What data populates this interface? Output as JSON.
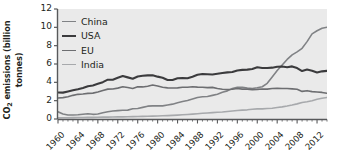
{
  "chart_data": {
    "type": "line",
    "title": "",
    "xlabel": "",
    "ylabel": "CO2 emissions (billion tonnes)",
    "ylabel_line1": "CO",
    "ylabel_sub": "2",
    "ylabel_line1_rest": " emissions (billion",
    "ylabel_line2": "tonnes)",
    "xlim": [
      1960,
      2014
    ],
    "ylim": [
      0,
      12
    ],
    "grid": false,
    "legend_position": "top-left",
    "y_ticks": [
      12,
      10,
      8,
      6,
      4,
      2,
      0
    ],
    "x_ticks": [
      1960,
      1964,
      1968,
      1972,
      1976,
      1980,
      1984,
      1988,
      1992,
      1996,
      2000,
      2004,
      2008,
      2012
    ],
    "x_tick_labels": [
      "1960",
      "1964",
      "1968",
      "1972",
      "1976",
      "1980",
      "1984",
      "1988",
      "1992",
      "1996",
      "2000",
      "2004",
      "2008",
      "2012"
    ],
    "x_minor_tick_interval": 1,
    "plot_background": "#eaeaea",
    "axis_color": "#58595b",
    "text_color": "#231f20",
    "x": [
      1960,
      1961,
      1962,
      1963,
      1964,
      1965,
      1966,
      1967,
      1968,
      1969,
      1970,
      1971,
      1972,
      1973,
      1974,
      1975,
      1976,
      1977,
      1978,
      1979,
      1980,
      1981,
      1982,
      1983,
      1984,
      1985,
      1986,
      1987,
      1988,
      1989,
      1990,
      1991,
      1992,
      1993,
      1994,
      1995,
      1996,
      1997,
      1998,
      1999,
      2000,
      2001,
      2002,
      2003,
      2004,
      2005,
      2006,
      2007,
      2008,
      2009,
      2010,
      2011,
      2012,
      2013,
      2014
    ],
    "series": [
      {
        "name": "China",
        "color": "#808285",
        "width": 1.6,
        "values": [
          0.78,
          0.55,
          0.44,
          0.44,
          0.47,
          0.52,
          0.58,
          0.51,
          0.54,
          0.68,
          0.79,
          0.87,
          0.91,
          0.96,
          0.97,
          1.12,
          1.15,
          1.27,
          1.4,
          1.43,
          1.45,
          1.43,
          1.52,
          1.62,
          1.77,
          1.9,
          2.02,
          2.18,
          2.35,
          2.42,
          2.46,
          2.58,
          2.7,
          2.92,
          3.07,
          3.33,
          3.46,
          3.47,
          3.38,
          3.32,
          3.4,
          3.52,
          3.89,
          4.59,
          5.29,
          5.9,
          6.5,
          6.99,
          7.32,
          7.71,
          8.44,
          9.29,
          9.63,
          9.9,
          10.01
        ]
      },
      {
        "name": "USA",
        "color": "#3b3b3d",
        "width": 2.1,
        "values": [
          2.89,
          2.88,
          3.0,
          3.13,
          3.25,
          3.39,
          3.57,
          3.66,
          3.84,
          4.02,
          4.29,
          4.29,
          4.5,
          4.69,
          4.54,
          4.39,
          4.63,
          4.71,
          4.76,
          4.77,
          4.62,
          4.5,
          4.26,
          4.26,
          4.45,
          4.46,
          4.45,
          4.62,
          4.83,
          4.91,
          4.89,
          4.85,
          4.93,
          5.02,
          5.09,
          5.12,
          5.3,
          5.36,
          5.39,
          5.46,
          5.64,
          5.56,
          5.57,
          5.6,
          5.7,
          5.72,
          5.65,
          5.74,
          5.56,
          5.23,
          5.39,
          5.27,
          5.08,
          5.2,
          5.25
        ]
      },
      {
        "name": "EU",
        "color": "#6d6e71",
        "width": 1.6,
        "values": [
          2.29,
          2.33,
          2.42,
          2.58,
          2.69,
          2.73,
          2.79,
          2.82,
          2.94,
          3.1,
          3.26,
          3.28,
          3.37,
          3.52,
          3.44,
          3.33,
          3.51,
          3.5,
          3.58,
          3.7,
          3.6,
          3.46,
          3.4,
          3.38,
          3.4,
          3.46,
          3.47,
          3.52,
          3.48,
          3.47,
          3.42,
          3.45,
          3.32,
          3.25,
          3.22,
          3.25,
          3.33,
          3.26,
          3.26,
          3.21,
          3.23,
          3.27,
          3.26,
          3.33,
          3.34,
          3.33,
          3.33,
          3.29,
          3.24,
          3.01,
          3.09,
          2.99,
          2.95,
          2.9,
          2.8
        ]
      },
      {
        "name": "India",
        "color": "#a7a9ac",
        "width": 1.6,
        "values": [
          0.12,
          0.13,
          0.14,
          0.15,
          0.16,
          0.17,
          0.18,
          0.18,
          0.19,
          0.2,
          0.21,
          0.22,
          0.23,
          0.23,
          0.24,
          0.26,
          0.27,
          0.29,
          0.3,
          0.31,
          0.32,
          0.35,
          0.37,
          0.39,
          0.42,
          0.46,
          0.49,
          0.53,
          0.58,
          0.62,
          0.66,
          0.7,
          0.74,
          0.77,
          0.82,
          0.88,
          0.93,
          0.97,
          1.0,
          1.07,
          1.1,
          1.11,
          1.14,
          1.18,
          1.25,
          1.32,
          1.41,
          1.52,
          1.65,
          1.8,
          1.89,
          2.0,
          2.16,
          2.26,
          2.34
        ]
      }
    ]
  },
  "legend": {
    "items": [
      {
        "label": "China"
      },
      {
        "label": "USA"
      },
      {
        "label": "EU"
      },
      {
        "label": "India"
      }
    ]
  }
}
